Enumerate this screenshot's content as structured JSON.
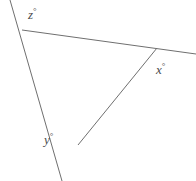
{
  "figure": {
    "background_color": "#ffffff",
    "line_color": "#6f6f6f",
    "label_color": "#4a4a4a",
    "line_width": 1,
    "degree_symbol": "°",
    "labels": {
      "x": {
        "text": "x",
        "degree": "°",
        "name": "angle-x"
      },
      "y": {
        "text": "y",
        "degree": "°",
        "name": "angle-y"
      },
      "z": {
        "text": "z",
        "degree": "°",
        "name": "angle-z"
      }
    },
    "vertices": {
      "top_left": {
        "x": 22,
        "y": 30
      },
      "right": {
        "x": 157,
        "y": 48
      },
      "bottom": {
        "x": 78,
        "y": 145
      }
    },
    "segments": [
      {
        "name": "top-side-extended",
        "x1": 22,
        "y1": 30,
        "x2": 196,
        "y2": 54
      },
      {
        "name": "left-side-extended",
        "x1": 10,
        "y1": 0,
        "x2": 62,
        "y2": 181
      },
      {
        "name": "right-side",
        "x1": 78,
        "y1": 145,
        "x2": 157,
        "y2": 48
      }
    ]
  }
}
